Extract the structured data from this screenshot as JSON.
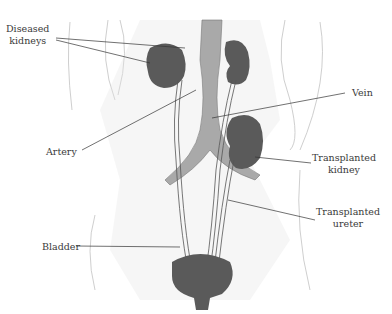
{
  "diagram": {
    "type": "anatomical-illustration",
    "labels": {
      "diseased_kidneys": [
        "Diseased",
        "kidneys"
      ],
      "artery": "Artery",
      "vein": "Vein",
      "transplanted_kidney": [
        "Transplanted",
        "kidney"
      ],
      "transplanted_ureter": [
        "Transplanted",
        "ureter"
      ],
      "bladder": "Bladder"
    },
    "colors": {
      "organ": "#5a5a5a",
      "vessel": "#a9a9a9",
      "sketch": "#d8d8d8",
      "leader_line": "#333333",
      "text": "#3a3a3a"
    }
  }
}
